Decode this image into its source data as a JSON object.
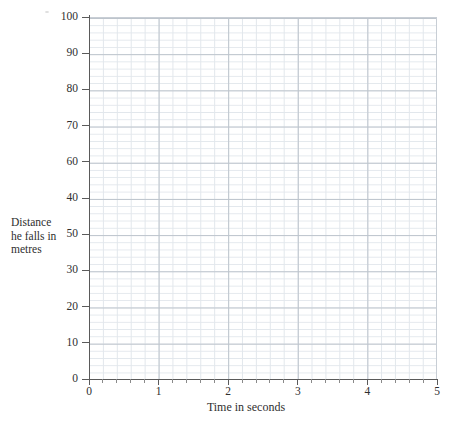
{
  "chart_data": {
    "type": "line",
    "title": "",
    "subtitle": "",
    "xlabel": "Time in seconds",
    "ylabel": "Distance he falls in metres",
    "xlim": [
      0,
      5
    ],
    "ylim": [
      0,
      100
    ],
    "grid": true,
    "legend": null,
    "series": [],
    "annotations": [],
    "note": "Blank graph paper axes provided for the student to plot on; no data points are drawn.",
    "x_ticks": [
      {
        "value": 0,
        "label": "0"
      },
      {
        "value": 1,
        "label": "1"
      },
      {
        "value": 2,
        "label": "2"
      },
      {
        "value": 3,
        "label": "3"
      },
      {
        "value": 4,
        "label": "4"
      },
      {
        "value": 5,
        "label": "5"
      }
    ],
    "x_minor_ticks_per_major": 5,
    "y_ticks": [
      {
        "value": 100,
        "label": "100"
      },
      {
        "value": 90,
        "label": "90"
      },
      {
        "value": 80,
        "label": "80"
      },
      {
        "value": 70,
        "label": "70"
      },
      {
        "value": 60,
        "label": "60"
      },
      {
        "value": 50,
        "label": "40"
      },
      {
        "value": 40,
        "label": "50"
      },
      {
        "value": 30,
        "label": "30"
      },
      {
        "value": 20,
        "label": "20"
      },
      {
        "value": 10,
        "label": "10"
      },
      {
        "value": 0,
        "label": "0"
      }
    ],
    "y_minor_ticks_per_major": 5
  },
  "axes": {
    "y_title_lines": {
      "line1": "Distance",
      "line2": "he falls in",
      "line3": "metres"
    },
    "x_title": "Time in seconds"
  },
  "colors": {
    "background": "#ffffff",
    "grid_minor": "#e2e7ec",
    "grid_major": "#bdc4cc",
    "axis_line": "#5a5a5a",
    "text": "#2f2f2f"
  }
}
